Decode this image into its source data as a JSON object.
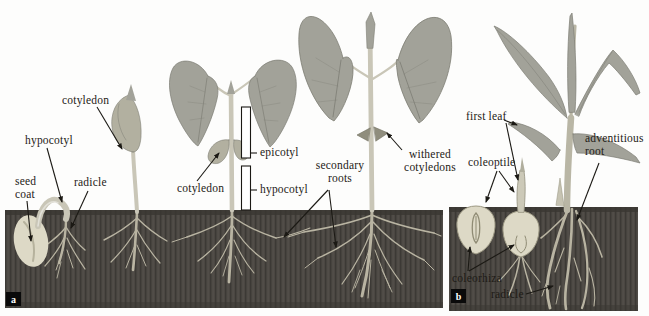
{
  "figure": {
    "colors": {
      "ink": "#1e1b16",
      "soil": "#4b4742",
      "soilDark": "#3a3732",
      "root": "#c3beab",
      "rootDim": "#a8a392",
      "leaf": "#a2a299",
      "leafDark": "#7d7d74",
      "stem": "#c9c6b7",
      "cotyledon": "#b2b0a0",
      "seed": "#ddd9c6",
      "seedShade": "#b6b29d",
      "witheredCot": "#8f8d7d"
    },
    "panel_a": {
      "letter": "a",
      "labels": {
        "cotyledon_seedling": "cotyledon",
        "hypocotyl_seedling": "hypocotyl",
        "seed_coat": "seed coat",
        "radicle": "radicle",
        "epicotyl": "epicotyl",
        "cotyledon_plant": "cotyledon",
        "hypocotyl_plant": "hypocotyl",
        "secondary_roots": "secondary roots",
        "withered_cotyledons": "withered cotyledons"
      }
    },
    "panel_b": {
      "letter": "b",
      "labels": {
        "first_leaf": "first leaf",
        "coleoptile": "coleoptile",
        "adventitious_root": "adventitious root",
        "coleorhiza": "coleorhiza",
        "radicle": "radicle"
      }
    }
  }
}
